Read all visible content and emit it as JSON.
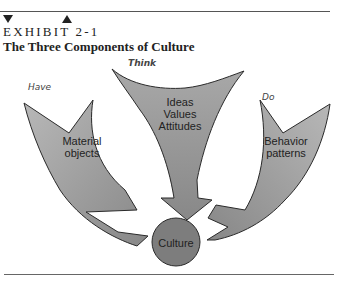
{
  "header": {
    "markers": [
      "triangle-down-filled",
      "triangle-up-filled",
      "triangle-down-outline"
    ],
    "exhibit_label": "EXHIBIT  2-1",
    "title": "The Three Components of Culture"
  },
  "diagram": {
    "components": [
      {
        "id": "material",
        "label_line1": "Material",
        "label_line2": "objects",
        "handwritten_note": "Have"
      },
      {
        "id": "ideas",
        "label_line1": "Ideas",
        "label_line2": "Values",
        "label_line3": "Attitudes",
        "handwritten_note": "Think"
      },
      {
        "id": "behavior",
        "label_line1": "Behavior",
        "label_line2": "patterns",
        "handwritten_note": "Do"
      }
    ],
    "center": {
      "label": "Culture"
    },
    "colors": {
      "arrow_fill": "#8f8f8f",
      "arrow_fill_light": "#b5b5b5",
      "outline": "#2a2a2a",
      "circle_fill": "#7d7d7d"
    }
  }
}
